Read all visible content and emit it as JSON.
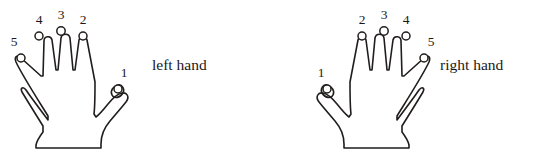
{
  "figure": {
    "background_color": "#ffffff",
    "stroke_color": "#201d1c",
    "text_color": "#1b1918"
  },
  "hands": [
    {
      "id": "left-hand",
      "caption": "left hand",
      "caption_x": 152,
      "caption_y": 70,
      "fingers": [
        {
          "name": "thumb",
          "number": "1",
          "label_x": 124,
          "label_y": 77,
          "tip_cx": 118,
          "tip_cy": 89,
          "tip_r": 4.0
        },
        {
          "name": "index-finger",
          "number": "2",
          "label_x": 83,
          "label_y": 24,
          "tip_cx": 83,
          "tip_cy": 36,
          "tip_r": 4.0
        },
        {
          "name": "middle-finger",
          "number": "3",
          "label_x": 61,
          "label_y": 19,
          "tip_cx": 61,
          "tip_cy": 31,
          "tip_r": 4.2
        },
        {
          "name": "ring-finger",
          "number": "4",
          "label_x": 39,
          "label_y": 24,
          "tip_cx": 39,
          "tip_cy": 36,
          "tip_r": 4.0
        },
        {
          "name": "little-finger",
          "number": "5",
          "label_x": 14,
          "label_y": 46,
          "tip_cx": 21,
          "tip_cy": 58,
          "tip_r": 4.0
        }
      ]
    },
    {
      "id": "right-hand",
      "caption": "right hand",
      "caption_x": 440,
      "caption_y": 70,
      "fingers": [
        {
          "name": "thumb",
          "number": "1",
          "label_x": 321,
          "label_y": 77,
          "tip_cx": 327,
          "tip_cy": 89,
          "tip_r": 4.0
        },
        {
          "name": "index-finger",
          "number": "2",
          "label_x": 362,
          "label_y": 24,
          "tip_cx": 362,
          "tip_cy": 36,
          "tip_r": 4.0
        },
        {
          "name": "middle-finger",
          "number": "3",
          "label_x": 384,
          "label_y": 19,
          "tip_cx": 384,
          "tip_cy": 31,
          "tip_r": 4.2
        },
        {
          "name": "ring-finger",
          "number": "4",
          "label_x": 406,
          "label_y": 24,
          "tip_cx": 406,
          "tip_cy": 36,
          "tip_r": 4.0
        },
        {
          "name": "little-finger",
          "number": "5",
          "label_x": 431,
          "label_y": 46,
          "tip_cx": 424,
          "tip_cy": 58,
          "tip_r": 4.0
        }
      ]
    }
  ],
  "geometry": {
    "left_hand_path": "M 21 58 C 17 54 14 57 16 62 C 22 75 40 103 48 116 L 48 120 C 42 112 30 96 26 90 C 23 86 20 88 22 92 C 28 102 38 118 43 126 L 43 132 C 40 136 37 140 36 145 L 36 148 L 101 148 L 101 144 C 101 136 104 128 110 121 C 116 114 122 107 126 102 C 130 97 127 92 122 93 C 117 94 112 99 108 104 C 104 109 100 114 96 117 L 94 114 C 95 106 95 94 95 82 L 87 40 C 86 36 80 36 79 40 L 75 70 L 73 70 L 70 38 C 69 33 62 33 61 38 L 58 70 L 56 70 L 52 40 C 51 35 44 36 44 41 L 43 76 L 41 76 Z",
    "left_thumb_tip_path": "M 118 85 C 113 86 110 91 112 95 C 114 99 120 98 123 93 C 125 89 122 84 118 85 Z",
    "right_hand_path": "M 424 58 C 428 54 431 57 429 62 C 423 75 405 103 397 116 L 397 120 C 403 112 415 96 419 90 C 422 86 425 88 423 92 C 417 102 407 118 402 126 L 402 132 C 405 136 408 140 409 145 L 409 148 L 344 148 L 344 144 C 344 136 341 128 335 121 C 329 114 323 107 319 102 C 315 97 318 92 323 93 C 328 94 333 99 337 104 C 341 109 345 114 349 117 L 351 114 C 350 106 350 94 350 82 L 358 40 C 359 36 365 36 366 40 L 370 70 L 372 70 L 375 38 C 376 33 383 33 384 38 L 387 70 L 389 70 L 393 40 C 394 35 401 36 401 41 L 402 76 L 404 76 Z",
    "right_thumb_tip_path": "M 327 85 C 332 86 335 91 333 95 C 331 99 325 98 322 93 C 320 89 323 84 327 85 Z"
  }
}
